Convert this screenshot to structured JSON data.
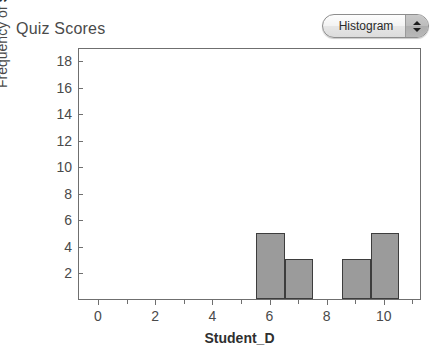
{
  "header": {
    "title": "Quiz Scores",
    "plot_type_selector": {
      "value": "Histogram",
      "up_arrow": "arrow-up-icon",
      "down_arrow": "arrow-down-icon"
    }
  },
  "chart_data": {
    "type": "bar",
    "title": "Quiz Scores",
    "xlabel": "Student_D",
    "ylabel_prefix": "Frequency of ",
    "ylabel_variable": "Student_D",
    "ylabel": "Frequency of Student_D",
    "xlim": [
      -0.7,
      11.3
    ],
    "ylim": [
      0,
      19
    ],
    "xticks": [
      0,
      2,
      4,
      6,
      8,
      10
    ],
    "xtick_labels": [
      "0",
      "2",
      "4",
      "6",
      "8",
      "10"
    ],
    "xminor_ticks": [
      1,
      3,
      5,
      7,
      9,
      11
    ],
    "yticks": [
      2,
      4,
      6,
      8,
      10,
      12,
      14,
      16,
      18
    ],
    "ytick_labels": [
      "2",
      "4",
      "6",
      "8",
      "10",
      "12",
      "14",
      "16",
      "18"
    ],
    "grid": false,
    "legend": false,
    "bin_width": 1,
    "bars": [
      {
        "bin_start": 5.5,
        "bin_end": 6.5,
        "center": 6,
        "value": 5
      },
      {
        "bin_start": 6.5,
        "bin_end": 7.5,
        "center": 7,
        "value": 3
      },
      {
        "bin_start": 8.5,
        "bin_end": 9.5,
        "center": 9,
        "value": 3
      },
      {
        "bin_start": 9.5,
        "bin_end": 10.5,
        "center": 10,
        "value": 5
      }
    ],
    "bar_fill_color": "#9b9b9b",
    "bar_edge_color": "#3d3d3d",
    "axis_color": "#6f6f6f",
    "background_color": "#ffffff"
  }
}
